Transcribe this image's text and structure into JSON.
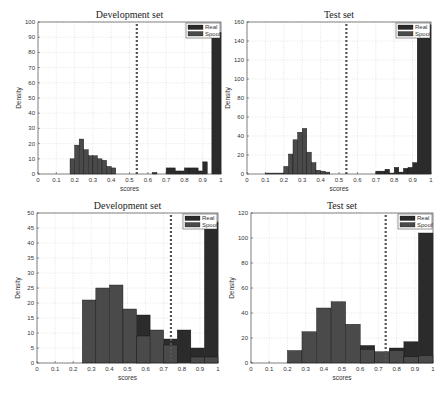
{
  "chart_data": [
    {
      "type": "bar",
      "panel": "top-left",
      "title": "Development set",
      "xlabel": "scores",
      "ylabel": "Density",
      "xlim": [
        0,
        1
      ],
      "ylim": [
        0,
        100
      ],
      "xticks": [
        "0",
        "0.1",
        "0.2",
        "0.3",
        "0.4",
        "0.5",
        "0.6",
        "0.7",
        "0.8",
        "0.9",
        "1"
      ],
      "yticks": [
        "0",
        "10",
        "20",
        "30",
        "40",
        "50",
        "60",
        "70",
        "80",
        "90",
        "100"
      ],
      "grid": true,
      "legend": [
        "Real",
        "Spoof"
      ],
      "legend_position": "upper right",
      "threshold": 0.54,
      "series": [
        {
          "name": "Spoof",
          "bins": [
            [
              0.175,
              0.2,
              10
            ],
            [
              0.2,
              0.225,
              19
            ],
            [
              0.225,
              0.25,
              23
            ],
            [
              0.25,
              0.275,
              16
            ],
            [
              0.275,
              0.3,
              12
            ],
            [
              0.3,
              0.325,
              12
            ],
            [
              0.325,
              0.35,
              10
            ],
            [
              0.35,
              0.375,
              9
            ],
            [
              0.375,
              0.4,
              5
            ],
            [
              0.4,
              0.425,
              4
            ]
          ]
        },
        {
          "name": "Real",
          "bins": [
            [
              0.625,
              0.65,
              1
            ],
            [
              0.7,
              0.725,
              4
            ],
            [
              0.725,
              0.75,
              4
            ],
            [
              0.75,
              0.775,
              2
            ],
            [
              0.775,
              0.8,
              2
            ],
            [
              0.8,
              0.825,
              4
            ],
            [
              0.825,
              0.85,
              4
            ],
            [
              0.85,
              0.875,
              4
            ],
            [
              0.875,
              0.9,
              2
            ],
            [
              0.9,
              0.925,
              8
            ],
            [
              0.925,
              0.95,
              0
            ],
            [
              0.95,
              1.0,
              93
            ]
          ]
        }
      ]
    },
    {
      "type": "bar",
      "panel": "top-right",
      "title": "Test set",
      "xlabel": "scores",
      "ylabel": "Density",
      "xlim": [
        0,
        1
      ],
      "ylim": [
        0,
        160
      ],
      "xticks": [
        "0",
        "0.1",
        "0.2",
        "0.3",
        "0.4",
        "0.5",
        "0.6",
        "0.7",
        "0.8",
        "0.9",
        "1"
      ],
      "yticks": [
        "0",
        "20",
        "40",
        "60",
        "80",
        "100",
        "120",
        "140",
        "160"
      ],
      "grid": true,
      "legend": [
        "Real",
        "Spoof"
      ],
      "legend_position": "upper right",
      "threshold": 0.54,
      "series": [
        {
          "name": "Spoof",
          "bins": [
            [
              0.1,
              0.2,
              1
            ],
            [
              0.2,
              0.225,
              8
            ],
            [
              0.225,
              0.25,
              21
            ],
            [
              0.25,
              0.275,
              36
            ],
            [
              0.275,
              0.3,
              44
            ],
            [
              0.3,
              0.325,
              48
            ],
            [
              0.325,
              0.35,
              23
            ],
            [
              0.35,
              0.375,
              12
            ],
            [
              0.375,
              0.4,
              4
            ],
            [
              0.4,
              0.425,
              3
            ],
            [
              0.425,
              0.45,
              2
            ]
          ]
        },
        {
          "name": "Real",
          "bins": [
            [
              0.7,
              0.725,
              3
            ],
            [
              0.725,
              0.75,
              3
            ],
            [
              0.75,
              0.775,
              5
            ],
            [
              0.775,
              0.8,
              1
            ],
            [
              0.8,
              0.825,
              7
            ],
            [
              0.825,
              0.85,
              2
            ],
            [
              0.85,
              0.875,
              6
            ],
            [
              0.875,
              0.9,
              7
            ],
            [
              0.9,
              0.925,
              12
            ],
            [
              0.925,
              1.0,
              157
            ]
          ]
        }
      ]
    },
    {
      "type": "bar",
      "panel": "bottom-left",
      "title": "Development set",
      "xlabel": "scores",
      "ylabel": "Density",
      "xlim": [
        0,
        1
      ],
      "ylim": [
        0,
        50
      ],
      "xticks": [
        "0",
        "0.1",
        "0.2",
        "0.3",
        "0.4",
        "0.5",
        "0.6",
        "0.7",
        "0.8",
        "0.9",
        "1"
      ],
      "yticks": [
        "0",
        "5",
        "10",
        "15",
        "20",
        "25",
        "30",
        "35",
        "40",
        "45",
        "50"
      ],
      "grid": true,
      "legend": [
        "Real",
        "Spoof"
      ],
      "legend_position": "upper right",
      "threshold": 0.74,
      "series": [
        {
          "name": "Real",
          "bins": [
            [
              0.55,
              0.625,
              16
            ],
            [
              0.7,
              0.775,
              8
            ],
            [
              0.775,
              0.85,
              11
            ],
            [
              0.85,
              0.925,
              5
            ],
            [
              0.925,
              1.0,
              47
            ]
          ]
        },
        {
          "name": "Spoof",
          "bins": [
            [
              0.25,
              0.325,
              21
            ],
            [
              0.325,
              0.4,
              25
            ],
            [
              0.4,
              0.475,
              26
            ],
            [
              0.475,
              0.55,
              18
            ],
            [
              0.55,
              0.625,
              9
            ],
            [
              0.625,
              0.7,
              11
            ],
            [
              0.7,
              0.775,
              6
            ],
            [
              0.775,
              0.85,
              0
            ],
            [
              0.85,
              0.925,
              2
            ],
            [
              0.925,
              1.0,
              2
            ]
          ]
        }
      ]
    },
    {
      "type": "bar",
      "panel": "bottom-right",
      "title": "Test set",
      "xlabel": "scores",
      "ylabel": "Density",
      "xlim": [
        0,
        1
      ],
      "ylim": [
        0,
        120
      ],
      "xticks": [
        "0",
        "0.1",
        "0.2",
        "0.3",
        "0.4",
        "0.5",
        "0.6",
        "0.7",
        "0.8",
        "0.9",
        "1"
      ],
      "yticks": [
        "0",
        "20",
        "40",
        "60",
        "80",
        "100",
        "120"
      ],
      "grid": true,
      "legend": [
        "Real",
        "Spoof"
      ],
      "legend_position": "upper right",
      "threshold": 0.74,
      "series": [
        {
          "name": "Real",
          "bins": [
            [
              0.6,
              0.68,
              14
            ],
            [
              0.76,
              0.84,
              12
            ],
            [
              0.84,
              0.92,
              17
            ],
            [
              0.92,
              1.0,
              104
            ]
          ]
        },
        {
          "name": "Spoof",
          "bins": [
            [
              0.2,
              0.28,
              10
            ],
            [
              0.28,
              0.36,
              25
            ],
            [
              0.36,
              0.44,
              44
            ],
            [
              0.44,
              0.52,
              49
            ],
            [
              0.52,
              0.6,
              31
            ],
            [
              0.6,
              0.68,
              11
            ],
            [
              0.68,
              0.76,
              9
            ],
            [
              0.76,
              0.84,
              10
            ],
            [
              0.84,
              0.92,
              5
            ],
            [
              0.92,
              1.0,
              6
            ]
          ]
        }
      ]
    }
  ],
  "colors": {
    "real": "#2b2b2b",
    "spoof": "#4a4a4a",
    "threshold": "#555555",
    "grid": "#cccccc",
    "axis": "#333333"
  },
  "layout": [
    {
      "left": 38,
      "top": 22,
      "width": 183,
      "height": 152
    },
    {
      "left": 247,
      "top": 22,
      "width": 184,
      "height": 152
    },
    {
      "left": 37,
      "top": 213,
      "width": 181,
      "height": 150
    },
    {
      "left": 251,
      "top": 213,
      "width": 182,
      "height": 150
    }
  ]
}
